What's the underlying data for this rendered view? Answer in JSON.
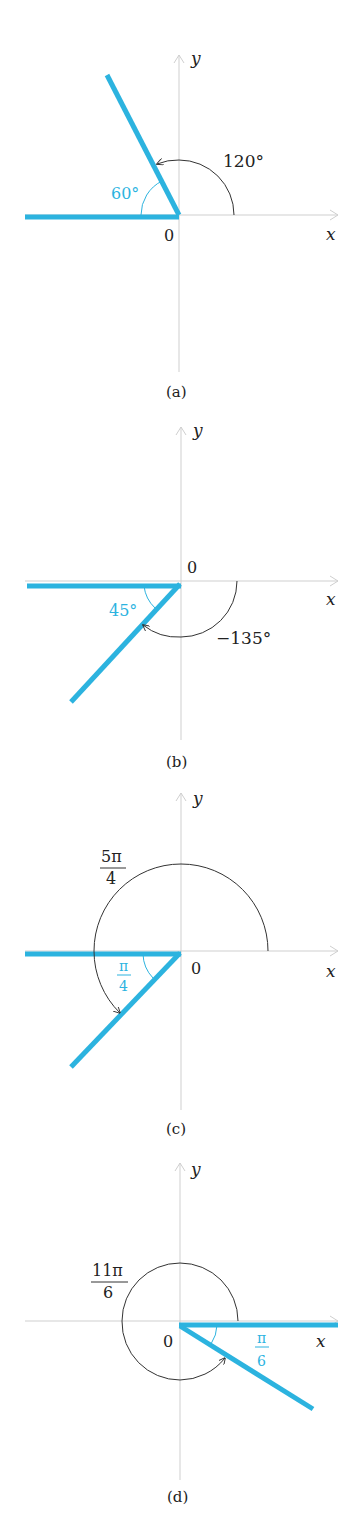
{
  "panels": [
    {
      "id": "a",
      "caption": "(a)",
      "origin_label": "0",
      "x_label": "x",
      "y_label": "y",
      "angle_label": "120°",
      "ref_angle_label": "60°",
      "angle_degrees": 120
    },
    {
      "id": "b",
      "caption": "(b)",
      "origin_label": "0",
      "x_label": "x",
      "y_label": "y",
      "angle_label": "−135°",
      "ref_angle_label": "45°",
      "angle_degrees": -135
    },
    {
      "id": "c",
      "caption": "(c)",
      "origin_label": "0",
      "x_label": "x",
      "y_label": "y",
      "angle_label_num": "5π",
      "angle_label_den": "4",
      "ref_angle_label_num": "π",
      "ref_angle_label_den": "4",
      "angle_radians": "5π/4"
    },
    {
      "id": "d",
      "caption": "(d)",
      "origin_label": "0",
      "x_label": "x",
      "y_label": "y",
      "angle_label_num": "11π",
      "angle_label_den": "6",
      "ref_angle_label_num": "π",
      "ref_angle_label_den": "6",
      "angle_radians": "11π/6"
    }
  ],
  "colors": {
    "terminal_ray": "#2cb3df",
    "axis": "#cfcfcf",
    "arc": "#333333"
  }
}
